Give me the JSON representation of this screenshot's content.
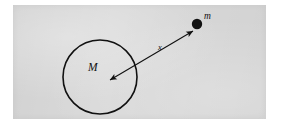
{
  "figure": {
    "kind": "physics-diagram",
    "caption": "",
    "panel": {
      "background_color": "#d9d9d9",
      "page_color": "#ffffff",
      "x": 13,
      "y": 5,
      "width": 253,
      "height": 114
    },
    "ink_color": "#111111"
  },
  "chart_data": {
    "type": "diagram",
    "title": "",
    "xlabel": "",
    "ylabel": "",
    "elements": [
      {
        "id": "central-body",
        "role": "large-mass",
        "shape": "circle-outline",
        "label": "M",
        "center_x": 100,
        "center_y": 77,
        "radius": 37,
        "stroke_color": "#111111",
        "stroke_width": 1.6,
        "fill": "none"
      },
      {
        "id": "point-mass",
        "role": "small-mass",
        "shape": "filled-circle",
        "label": "m",
        "center_x": 197,
        "center_y": 24,
        "radius": 5.2,
        "fill_color": "#111111"
      },
      {
        "id": "separation-arrow",
        "role": "distance-measure",
        "shape": "double-headed-arrow",
        "label": "x",
        "from_x": 110,
        "from_y": 80,
        "to_x": 193,
        "to_y": 31,
        "stroke_color": "#111111",
        "stroke_width": 1.1
      }
    ],
    "labels": [
      {
        "id": "label-M",
        "text": "M",
        "x": 88,
        "y": 71,
        "style": "italic-serif",
        "size": 11.5
      },
      {
        "id": "label-m",
        "text": "m",
        "x": 204,
        "y": 19,
        "style": "italic-serif",
        "size": 9.5
      },
      {
        "id": "label-x",
        "text": "x",
        "x": 158,
        "y": 50,
        "style": "italic-serif",
        "size": 8.5
      }
    ],
    "legend": [],
    "annotations": [
      "M denotes the large central mass drawn as an open circle",
      "m denotes the small point mass drawn as a filled dot",
      "x denotes the separation between the centre of M and the point mass m"
    ],
    "grid": false
  },
  "labels": {
    "large_mass": "M",
    "small_mass": "m",
    "distance": "x"
  }
}
